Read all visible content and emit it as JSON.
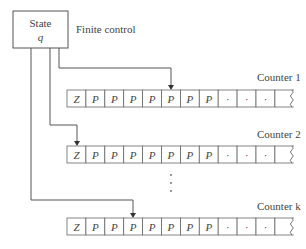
{
  "diagram": {
    "state_box": {
      "title": "State",
      "variable": "q"
    },
    "finite_control_label": "Finite control",
    "counters": [
      {
        "label": "Counter 1",
        "head_cell": 5,
        "cells": [
          "Z",
          "P",
          "P",
          "P",
          "P",
          "P",
          "P",
          "P",
          "·",
          "·",
          "·",
          ""
        ]
      },
      {
        "label": "Counter 2",
        "head_cell": 0,
        "cells": [
          "Z",
          "P",
          "P",
          "P",
          "P",
          "P",
          "P",
          "P",
          "·",
          "·",
          "·",
          ""
        ]
      },
      {
        "label": "Counter k",
        "head_cell": 3,
        "cells": [
          "Z",
          "P",
          "P",
          "P",
          "P",
          "P",
          "P",
          "P",
          "·",
          "·",
          "·",
          ""
        ]
      }
    ],
    "ellipsis": "⋮",
    "colors": {
      "line": "#555555",
      "cell_border": "#666666",
      "text": "#444444"
    }
  }
}
